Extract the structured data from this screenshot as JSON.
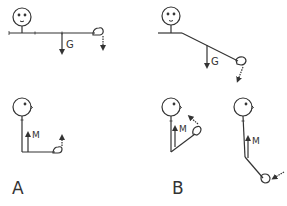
{
  "diagram": {
    "title": "",
    "colors": {
      "stroke": "#333333",
      "background": "#ffffff"
    },
    "panels": [
      {
        "id": "A",
        "label": "A",
        "figures": [
          {
            "position": "arm-horizontal",
            "force_label": "G",
            "force": "gravity",
            "hand_arrow": "down"
          },
          {
            "position": "elbow-flexed-90",
            "force_label": "M",
            "force": "muscle",
            "hand_arrow": "up"
          }
        ]
      },
      {
        "id": "B",
        "label": "B",
        "figures": [
          {
            "position": "arm-angled-down",
            "force_label": "G",
            "force": "gravity",
            "hand_arrow": "down"
          },
          {
            "position": "elbow-flexed-acute",
            "force_label": "M",
            "force": "muscle",
            "hand_arrow": "up-left"
          },
          {
            "position": "forearm-extended-down",
            "force_label": "M",
            "force": "muscle",
            "hand_arrow": "left"
          }
        ]
      }
    ],
    "labels": {
      "panel_a": "A",
      "panel_b": "B",
      "gravity": "G",
      "muscle": "M"
    }
  }
}
